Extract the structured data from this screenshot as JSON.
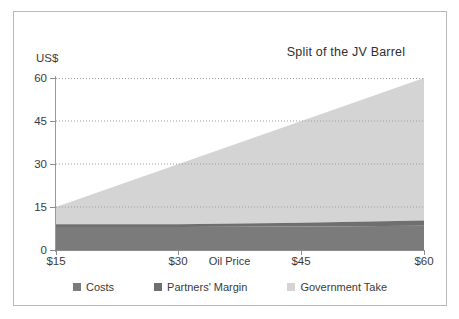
{
  "chart_data": {
    "type": "area",
    "title": "Split of the JV Barrel",
    "xlabel": "Oil Price",
    "ylabel": "US$",
    "stacked": true,
    "grid": true,
    "legend_position": "bottom",
    "xlim": [
      15,
      60
    ],
    "ylim": [
      0,
      60
    ],
    "x": [
      15,
      30,
      45,
      60
    ],
    "xtick_labels": [
      "$15",
      "$30",
      "$45",
      "$60"
    ],
    "ytick_labels": [
      "0",
      "15",
      "30",
      "45",
      "60"
    ],
    "ytick_values": [
      0,
      15,
      30,
      45,
      60
    ],
    "series": [
      {
        "name": "Costs",
        "color": "#7b7b7b",
        "values": [
          8.0,
          8.0,
          8.2,
          8.5
        ]
      },
      {
        "name": "Partners' Margin",
        "color": "#6f6f6f",
        "values": [
          1.0,
          1.0,
          1.3,
          1.8
        ]
      },
      {
        "name": "Government Take",
        "color": "#d4d4d4",
        "values": [
          6.0,
          21.0,
          35.5,
          49.7
        ]
      }
    ],
    "totals": [
      15,
      30,
      45,
      60
    ],
    "annotations": []
  },
  "legend": {
    "items": [
      {
        "label": "Costs",
        "swatch": "legend-swatch-costs"
      },
      {
        "label": "Partners' Margin",
        "swatch": "legend-swatch-partners-margin"
      },
      {
        "label": "Government Take",
        "swatch": "legend-swatch-government-take"
      }
    ]
  },
  "colors": {
    "costs": "#7b7b7b",
    "partners_margin": "#6f6f6f",
    "government_take": "#d4d4d4",
    "grid": "#bdbdbd",
    "axis": "#8d8d8d",
    "frame": "#b9b9b9",
    "text": "#3a3a3a"
  }
}
